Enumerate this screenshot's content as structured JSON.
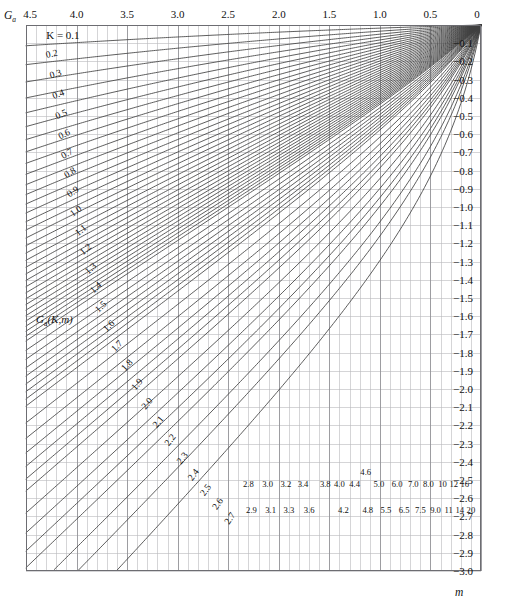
{
  "figure": {
    "y_axis_name": "Ga",
    "y_axis_sub": "a",
    "x_axis_name": "m",
    "function_label": "G",
    "function_label_sub": "a",
    "function_label_args": "(K,m)",
    "first_curve_prefix": "K = 0.1",
    "colors": {
      "grid": "#b9b9bd",
      "curve": "#404040",
      "frame": "#6d6d72",
      "text": "#111111",
      "background": "#ffffff"
    }
  },
  "chart_data": {
    "type": "line",
    "title": "",
    "subtitle": "",
    "xlabel": "m",
    "ylabel": "Ga(K,m)",
    "grid": true,
    "legend": "inline-curve-labels",
    "xlim": [
      4.5,
      0.0
    ],
    "ylim": [
      -3.0,
      0.0
    ],
    "x_axis_position": "top",
    "y_axis_position": "right",
    "x_direction": "decreasing",
    "xticks": [
      "4.5",
      "4.0",
      "3.5",
      "3.0",
      "2.5",
      "2.0",
      "1.5",
      "1.0",
      "0.5",
      "0"
    ],
    "xtick_values": [
      4.5,
      4.0,
      3.5,
      3.0,
      2.5,
      2.0,
      1.5,
      1.0,
      0.5,
      0.0
    ],
    "x_minor_step": 0.1,
    "yticks": [
      "-0.1",
      "-0.2",
      "-0.3",
      "-0.4",
      "-0.5",
      "-0.6",
      "-0.7",
      "-0.8",
      "-0.9",
      "-1.0",
      "-1.1",
      "-1.2",
      "-1.3",
      "-1.4",
      "-1.5",
      "-1.6",
      "-1.7",
      "-1.8",
      "-1.9",
      "-2.0",
      "-2.1",
      "-2.2",
      "-2.3",
      "-2.4",
      "-2.5",
      "-2.6",
      "-2.7",
      "-2.8",
      "-2.9",
      "-3.0"
    ],
    "ytick_values": [
      -0.1,
      -0.2,
      -0.3,
      -0.4,
      -0.5,
      -0.6,
      -0.7,
      -0.8,
      -0.9,
      -1.0,
      -1.1,
      -1.2,
      -1.3,
      -1.4,
      -1.5,
      -1.6,
      -1.7,
      -1.8,
      -1.9,
      -2.0,
      -2.1,
      -2.2,
      -2.3,
      -2.4,
      -2.5,
      -2.6,
      -2.7,
      -2.8,
      -2.9,
      -3.0
    ],
    "y_minor_step": 0.1,
    "series_parameter": "K",
    "series": [
      {
        "name": "0.1",
        "K": 0.1,
        "label_x": 4.22,
        "label_y": -0.055,
        "label_rot": -4
      },
      {
        "name": "0.2",
        "K": 0.2,
        "label_x": 4.24,
        "label_y": -0.175,
        "label_rot": -12
      },
      {
        "name": "0.3",
        "K": 0.3,
        "label_x": 4.2,
        "label_y": -0.285,
        "label_rot": -17
      },
      {
        "name": "0.4",
        "K": 0.4,
        "label_x": 4.17,
        "label_y": -0.395,
        "label_rot": -21
      },
      {
        "name": "0.5",
        "K": 0.5,
        "label_x": 4.14,
        "label_y": -0.505,
        "label_rot": -24
      },
      {
        "name": "0.6",
        "K": 0.6,
        "label_x": 4.11,
        "label_y": -0.615,
        "label_rot": -27
      },
      {
        "name": "0.7",
        "K": 0.7,
        "label_x": 4.08,
        "label_y": -0.72,
        "label_rot": -30
      },
      {
        "name": "0.8",
        "K": 0.8,
        "label_x": 4.05,
        "label_y": -0.825,
        "label_rot": -32
      },
      {
        "name": "0.9",
        "K": 0.9,
        "label_x": 4.02,
        "label_y": -0.93,
        "label_rot": -34
      },
      {
        "name": "1.0",
        "K": 1.0,
        "label_x": 3.99,
        "label_y": -1.035,
        "label_rot": -36
      },
      {
        "name": "1.1",
        "K": 1.1,
        "label_x": 3.94,
        "label_y": -1.14,
        "label_rot": -38
      },
      {
        "name": "1.2",
        "K": 1.2,
        "label_x": 3.89,
        "label_y": -1.245,
        "label_rot": -40
      },
      {
        "name": "1.3",
        "K": 1.3,
        "label_x": 3.84,
        "label_y": -1.35,
        "label_rot": -42
      },
      {
        "name": "1.4",
        "K": 1.4,
        "label_x": 3.79,
        "label_y": -1.455,
        "label_rot": -43
      },
      {
        "name": "1.5",
        "K": 1.5,
        "label_x": 3.74,
        "label_y": -1.56,
        "label_rot": -44
      },
      {
        "name": "1.6",
        "K": 1.6,
        "label_x": 3.66,
        "label_y": -1.665,
        "label_rot": -45
      },
      {
        "name": "1.7",
        "K": 1.7,
        "label_x": 3.58,
        "label_y": -1.775,
        "label_rot": -46
      },
      {
        "name": "1.8",
        "K": 1.8,
        "label_x": 3.48,
        "label_y": -1.88,
        "label_rot": -47
      },
      {
        "name": "1.9",
        "K": 1.9,
        "label_x": 3.38,
        "label_y": -1.985,
        "label_rot": -48
      },
      {
        "name": "2.0",
        "K": 2.0,
        "label_x": 3.28,
        "label_y": -2.09,
        "label_rot": -49
      },
      {
        "name": "2.1",
        "K": 2.1,
        "label_x": 3.17,
        "label_y": -2.19,
        "label_rot": -50
      },
      {
        "name": "2.2",
        "K": 2.2,
        "label_x": 3.05,
        "label_y": -2.29,
        "label_rot": -51
      },
      {
        "name": "2.3",
        "K": 2.3,
        "label_x": 2.93,
        "label_y": -2.39,
        "label_rot": -52
      },
      {
        "name": "2.4",
        "K": 2.4,
        "label_x": 2.82,
        "label_y": -2.48,
        "label_rot": -53
      },
      {
        "name": "2.5",
        "K": 2.5,
        "label_x": 2.7,
        "label_y": -2.565,
        "label_rot": -54
      },
      {
        "name": "2.6",
        "K": 2.6,
        "label_x": 2.58,
        "label_y": -2.64,
        "label_rot": -55
      },
      {
        "name": "2.7",
        "K": 2.7,
        "label_x": 2.46,
        "label_y": -2.72,
        "label_rot": -56
      },
      {
        "name": "2.8",
        "K": 2.8,
        "label_x": 2.3,
        "label_y": -2.54,
        "label_rot": 0
      },
      {
        "name": "2.9",
        "K": 2.9,
        "label_x": 2.27,
        "label_y": -2.68,
        "label_rot": 0
      },
      {
        "name": "3.0",
        "K": 3.0,
        "label_x": 2.11,
        "label_y": -2.54,
        "label_rot": 0
      },
      {
        "name": "3.1",
        "K": 3.1,
        "label_x": 2.08,
        "label_y": -2.68,
        "label_rot": 0
      },
      {
        "name": "3.2",
        "K": 3.2,
        "label_x": 1.93,
        "label_y": -2.54,
        "label_rot": 0
      },
      {
        "name": "3.3",
        "K": 3.3,
        "label_x": 1.9,
        "label_y": -2.68,
        "label_rot": 0
      },
      {
        "name": "3.4",
        "K": 3.4,
        "label_x": 1.76,
        "label_y": -2.54,
        "label_rot": 0
      },
      {
        "name": "3.6",
        "K": 3.6,
        "label_x": 1.7,
        "label_y": -2.68,
        "label_rot": 0
      },
      {
        "name": "3.8",
        "K": 3.8,
        "label_x": 1.54,
        "label_y": -2.54,
        "label_rot": 0
      },
      {
        "name": "4.0",
        "K": 4.0,
        "label_x": 1.4,
        "label_y": -2.54,
        "label_rot": 0
      },
      {
        "name": "4.2",
        "K": 4.2,
        "label_x": 1.36,
        "label_y": -2.68,
        "label_rot": 0
      },
      {
        "name": "4.4",
        "K": 4.4,
        "label_x": 1.25,
        "label_y": -2.54,
        "label_rot": 0
      },
      {
        "name": "4.6",
        "K": 4.6,
        "label_x": 1.14,
        "label_y": -2.47,
        "label_rot": 0
      },
      {
        "name": "4.8",
        "K": 4.8,
        "label_x": 1.12,
        "label_y": -2.68,
        "label_rot": 0
      },
      {
        "name": "5.0",
        "K": 5.0,
        "label_x": 1.01,
        "label_y": -2.54,
        "label_rot": 0
      },
      {
        "name": "5.5",
        "K": 5.5,
        "label_x": 0.94,
        "label_y": -2.68,
        "label_rot": 0
      },
      {
        "name": "6.0",
        "K": 6.0,
        "label_x": 0.83,
        "label_y": -2.54,
        "label_rot": 0
      },
      {
        "name": "6.5",
        "K": 6.5,
        "label_x": 0.76,
        "label_y": -2.68,
        "label_rot": 0
      },
      {
        "name": "7.0",
        "K": 7.0,
        "label_x": 0.67,
        "label_y": -2.54,
        "label_rot": 0
      },
      {
        "name": "7.5",
        "K": 7.5,
        "label_x": 0.6,
        "label_y": -2.68,
        "label_rot": 0
      },
      {
        "name": "8.0",
        "K": 8.0,
        "label_x": 0.52,
        "label_y": -2.54,
        "label_rot": 0
      },
      {
        "name": "9.0",
        "K": 9.0,
        "label_x": 0.45,
        "label_y": -2.68,
        "label_rot": 0
      },
      {
        "name": "10",
        "K": 10,
        "label_x": 0.38,
        "label_y": -2.54,
        "label_rot": 0
      },
      {
        "name": "11",
        "K": 11,
        "label_x": 0.32,
        "label_y": -2.68,
        "label_rot": 0
      },
      {
        "name": "12",
        "K": 12,
        "label_x": 0.27,
        "label_y": -2.54,
        "label_rot": 0
      },
      {
        "name": "14",
        "K": 14,
        "label_x": 0.21,
        "label_y": -2.68,
        "label_rot": 0
      },
      {
        "name": "16",
        "K": 16,
        "label_x": 0.16,
        "label_y": -2.54,
        "label_rot": 0
      },
      {
        "name": "20",
        "K": 20,
        "label_x": 0.1,
        "label_y": -2.68,
        "label_rot": 0
      }
    ],
    "annotations": [
      {
        "text": "K = 0.1",
        "x": 4.24,
        "y": -0.06
      },
      {
        "text": "Ga(K,m)",
        "x": 4.35,
        "y": -1.63
      }
    ]
  }
}
